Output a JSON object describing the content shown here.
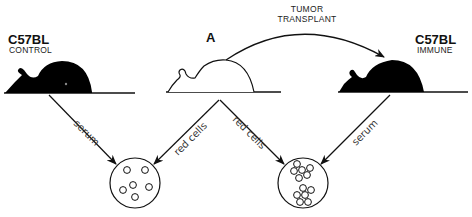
{
  "diagram": {
    "mice": [
      {
        "id": "left",
        "strain": "C57BL",
        "status": "CONTROL",
        "fill": "#000000"
      },
      {
        "id": "center",
        "strain": "A",
        "status": "",
        "fill": "#ffffff"
      },
      {
        "id": "right",
        "strain": "C57BL",
        "status": "IMMUNE",
        "fill": "#000000"
      }
    ],
    "transplant": {
      "line1": "TUMOR",
      "line2": "TRANSPLANT"
    },
    "edges": [
      {
        "from": "left-mouse",
        "to": "left-well",
        "label": "serum"
      },
      {
        "from": "center-mouse",
        "to": "left-well",
        "label": "red cells"
      },
      {
        "from": "center-mouse",
        "to": "right-well",
        "label": "red cells"
      },
      {
        "from": "right-mouse",
        "to": "right-well",
        "label": "serum"
      }
    ],
    "wells": [
      {
        "id": "left",
        "result": "dispersed cells (no agglutination)",
        "cell_count": 6
      },
      {
        "id": "right",
        "result": "clumped cells (agglutination)",
        "cell_count": 14
      }
    ]
  }
}
